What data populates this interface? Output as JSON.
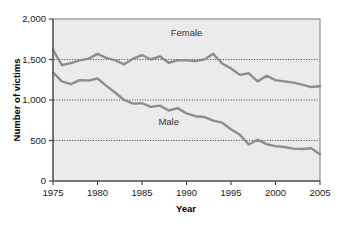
{
  "chart_data": {
    "type": "line",
    "title": "",
    "xlabel": "Year",
    "ylabel": "Number of victims",
    "xlim": [
      1975,
      2005
    ],
    "ylim": [
      0,
      2000
    ],
    "grid": "horizontal-dotted",
    "gridlines": [
      500,
      1000,
      1500
    ],
    "legend_position": "inline-annotations",
    "x_ticks": [
      "1975",
      "1980",
      "1985",
      "1990",
      "1995",
      "2000",
      "2005"
    ],
    "x_tick_values": [
      1975,
      1980,
      1985,
      1990,
      1995,
      2000,
      2005
    ],
    "y_ticks": [
      "0",
      "500",
      "1,000",
      "1,500",
      "2,000"
    ],
    "y_tick_values": [
      0,
      500,
      1000,
      1500,
      2000
    ],
    "x": [
      1975,
      1976,
      1977,
      1978,
      1979,
      1980,
      1981,
      1982,
      1983,
      1984,
      1985,
      1986,
      1987,
      1988,
      1989,
      1990,
      1991,
      1992,
      1993,
      1994,
      1995,
      1996,
      1997,
      1998,
      1999,
      2000,
      2001,
      2002,
      2003,
      2004,
      2005
    ],
    "series": [
      {
        "name": "Female",
        "label": "Female",
        "color": "#8d8d8d",
        "values": [
          1620,
          1430,
          1455,
          1490,
          1510,
          1570,
          1520,
          1490,
          1440,
          1510,
          1555,
          1500,
          1540,
          1460,
          1490,
          1490,
          1480,
          1500,
          1570,
          1450,
          1390,
          1310,
          1330,
          1230,
          1300,
          1245,
          1230,
          1215,
          1190,
          1160,
          1170
        ]
      },
      {
        "name": "Male",
        "label": "Male",
        "color": "#8d8d8d",
        "values": [
          1340,
          1230,
          1195,
          1245,
          1240,
          1265,
          1175,
          1090,
          1000,
          955,
          960,
          915,
          930,
          870,
          900,
          835,
          800,
          790,
          745,
          720,
          640,
          570,
          450,
          510,
          455,
          430,
          420,
          400,
          395,
          405,
          330
        ]
      }
    ],
    "annotations": [
      {
        "text": "Female",
        "x": 1990,
        "y": 1790
      },
      {
        "text": "Male",
        "x": 1988,
        "y": 690
      }
    ]
  },
  "style": {
    "plot_background": "#ebebeb",
    "frame_color": "#7d7d7d",
    "line_color": "#8d8d8d",
    "grid_color": "#3f3f3f",
    "text_color": "#1a1a1a"
  }
}
